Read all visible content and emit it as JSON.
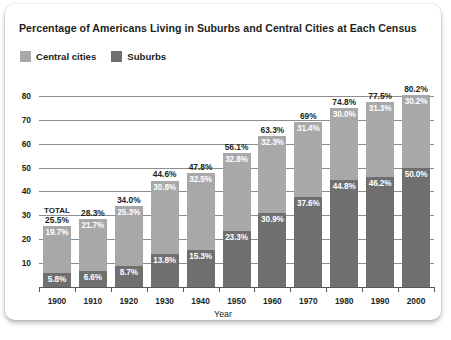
{
  "chart_data": {
    "type": "bar",
    "subtype": "stacked-bar",
    "title": "Percentage of Americans Living in Suburbs and Central Cities at Each Census",
    "xlabel": "Year",
    "ylabel": "",
    "categories": [
      "1900",
      "1910",
      "1920",
      "1930",
      "1940",
      "1950",
      "1960",
      "1970",
      "1980",
      "1990",
      "2000"
    ],
    "series": [
      {
        "name": "Suburbs",
        "color": "#706f6f",
        "values": [
          5.8,
          6.6,
          8.7,
          13.8,
          15.3,
          23.3,
          30.9,
          37.6,
          44.8,
          46.2,
          50.0
        ],
        "labels": [
          "5.8%",
          "6.6%",
          "8.7%",
          "13.8%",
          "15.3%",
          "23.3%",
          "30.9%",
          "37.6%",
          "44.8%",
          "46.2%",
          "50.0%"
        ]
      },
      {
        "name": "Central cities",
        "color": "#a9a8a8",
        "values": [
          19.7,
          21.7,
          25.3,
          30.8,
          32.5,
          32.8,
          32.3,
          31.4,
          30.0,
          31.3,
          30.2
        ],
        "labels": [
          "19.7%",
          "21.7%",
          "25.3%",
          "30.8%",
          "32.5%",
          "32.8%",
          "32.3%",
          "31.4%",
          "30.0%",
          "31.3%",
          "30.2%"
        ]
      }
    ],
    "totals": [
      25.5,
      28.3,
      34.0,
      44.6,
      47.8,
      56.1,
      63.3,
      69.0,
      74.8,
      77.5,
      80.2
    ],
    "total_labels": [
      "25.5%",
      "28.3%",
      "34.0%",
      "44.6%",
      "47.8%",
      "56.1%",
      "63.3%",
      "69%",
      "74.8%",
      "77.5%",
      "80.2%"
    ],
    "total_annotation": "TOTAL",
    "yticks": [
      10,
      20,
      30,
      40,
      50,
      60,
      70,
      80
    ],
    "ytick_labels": [
      "10",
      "20",
      "30",
      "40",
      "50",
      "60",
      "70",
      "80"
    ],
    "ylim": [
      0,
      85
    ],
    "grid": true,
    "legend_position": "top-left"
  }
}
